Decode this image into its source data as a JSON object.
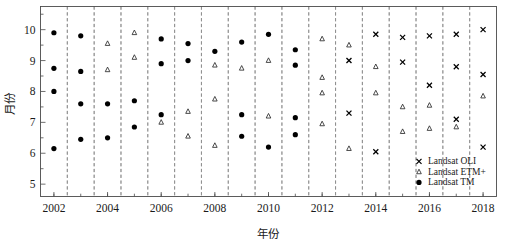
{
  "chart_data": {
    "type": "scatter",
    "title": "",
    "xlabel": "年份",
    "ylabel": "月份",
    "xlim": [
      2001.5,
      2018.5
    ],
    "ylim": [
      4.6,
      10.75
    ],
    "grid": "vertical dashed gridlines at half-year boundaries",
    "legend_position": "bottom-right inside axes",
    "xticks": [
      2002,
      2004,
      2006,
      2008,
      2010,
      2012,
      2014,
      2016,
      2018
    ],
    "xtick_labels": [
      "2002",
      "2004",
      "2006",
      "2008",
      "2010",
      "2012",
      "2014",
      "2016",
      "2018"
    ],
    "yticks": [
      5,
      6,
      7,
      8,
      9,
      10
    ],
    "ytick_labels": [
      "5",
      "6",
      "7",
      "8",
      "9",
      "10"
    ],
    "yticks_minor": [
      5.5,
      6.5,
      7.5,
      8.5,
      9.5,
      10.5
    ],
    "series": [
      {
        "name": "Landsat OLI",
        "marker": "x",
        "points": [
          {
            "x": 2013,
            "y": 9.0
          },
          {
            "x": 2013,
            "y": 7.3
          },
          {
            "x": 2014,
            "y": 9.85
          },
          {
            "x": 2014,
            "y": 6.05
          },
          {
            "x": 2015,
            "y": 9.75
          },
          {
            "x": 2015,
            "y": 8.95
          },
          {
            "x": 2016,
            "y": 9.8
          },
          {
            "x": 2016,
            "y": 8.2
          },
          {
            "x": 2017,
            "y": 9.85
          },
          {
            "x": 2017,
            "y": 8.8
          },
          {
            "x": 2017,
            "y": 7.1
          },
          {
            "x": 2018,
            "y": 10.0
          },
          {
            "x": 2018,
            "y": 8.55
          },
          {
            "x": 2018,
            "y": 6.2
          }
        ]
      },
      {
        "name": "Landsat ETM+",
        "marker": "triangle",
        "points": [
          {
            "x": 2004,
            "y": 9.55
          },
          {
            "x": 2004,
            "y": 8.7
          },
          {
            "x": 2005,
            "y": 9.9
          },
          {
            "x": 2005,
            "y": 9.1
          },
          {
            "x": 2006,
            "y": 7.0
          },
          {
            "x": 2007,
            "y": 7.35
          },
          {
            "x": 2007,
            "y": 6.55
          },
          {
            "x": 2008,
            "y": 8.85
          },
          {
            "x": 2008,
            "y": 7.75
          },
          {
            "x": 2008,
            "y": 6.25
          },
          {
            "x": 2009,
            "y": 8.75
          },
          {
            "x": 2010,
            "y": 9.0
          },
          {
            "x": 2010,
            "y": 7.2
          },
          {
            "x": 2012,
            "y": 9.7
          },
          {
            "x": 2012,
            "y": 8.45
          },
          {
            "x": 2012,
            "y": 7.95
          },
          {
            "x": 2012,
            "y": 6.95
          },
          {
            "x": 2013,
            "y": 9.5
          },
          {
            "x": 2013,
            "y": 6.15
          },
          {
            "x": 2014,
            "y": 8.8
          },
          {
            "x": 2014,
            "y": 7.95
          },
          {
            "x": 2015,
            "y": 7.5
          },
          {
            "x": 2015,
            "y": 6.7
          },
          {
            "x": 2016,
            "y": 7.55
          },
          {
            "x": 2016,
            "y": 6.8
          },
          {
            "x": 2017,
            "y": 6.85
          },
          {
            "x": 2018,
            "y": 7.85
          }
        ]
      },
      {
        "name": "Landsat TM",
        "marker": "circle",
        "points": [
          {
            "x": 2002,
            "y": 9.9
          },
          {
            "x": 2002,
            "y": 8.75
          },
          {
            "x": 2002,
            "y": 8.0
          },
          {
            "x": 2002,
            "y": 6.15
          },
          {
            "x": 2003,
            "y": 9.8
          },
          {
            "x": 2003,
            "y": 8.65
          },
          {
            "x": 2003,
            "y": 7.6
          },
          {
            "x": 2003,
            "y": 6.45
          },
          {
            "x": 2004,
            "y": 7.6
          },
          {
            "x": 2004,
            "y": 6.5
          },
          {
            "x": 2005,
            "y": 7.7
          },
          {
            "x": 2005,
            "y": 6.85
          },
          {
            "x": 2006,
            "y": 9.7
          },
          {
            "x": 2006,
            "y": 8.9
          },
          {
            "x": 2006,
            "y": 7.25
          },
          {
            "x": 2007,
            "y": 9.55
          },
          {
            "x": 2007,
            "y": 9.0
          },
          {
            "x": 2008,
            "y": 9.3
          },
          {
            "x": 2009,
            "y": 9.6
          },
          {
            "x": 2009,
            "y": 7.25
          },
          {
            "x": 2009,
            "y": 6.55
          },
          {
            "x": 2010,
            "y": 9.85
          },
          {
            "x": 2010,
            "y": 6.2
          },
          {
            "x": 2011,
            "y": 9.35
          },
          {
            "x": 2011,
            "y": 8.85
          },
          {
            "x": 2011,
            "y": 7.15
          },
          {
            "x": 2011,
            "y": 6.6
          }
        ]
      }
    ]
  },
  "legend": {
    "entries": [
      {
        "label": "Landsat OLI",
        "marker": "x"
      },
      {
        "label": "Landsat ETM+",
        "marker": "triangle"
      },
      {
        "label": "Landsat TM",
        "marker": "circle"
      }
    ]
  },
  "colors": {
    "marker": "#000000",
    "frame": "#4a4a4a",
    "gridline": "#8a8a8a",
    "background": "#ffffff"
  }
}
